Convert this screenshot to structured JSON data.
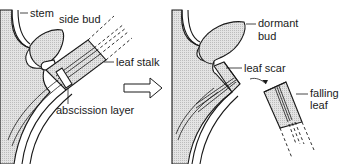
{
  "diagram": {
    "topic": "Leaf abscission",
    "before_panel": {
      "labels": {
        "stem": "stem",
        "side_bud": "side bud",
        "leaf_stalk": "leaf stalk",
        "abscission_layer": "abscission layer"
      }
    },
    "transition_arrow": "hollow-right-arrow",
    "after_panel": {
      "labels": {
        "dormant_bud_line1": "dormant",
        "dormant_bud_line2": "bud",
        "leaf_scar": "leaf scar",
        "falling_leaf_line1": "falling",
        "falling_leaf_line2": "leaf"
      }
    },
    "colors": {
      "line": "#1a1a1a",
      "tissue_fill": "#d9d9d9",
      "background": "#ffffff"
    }
  }
}
